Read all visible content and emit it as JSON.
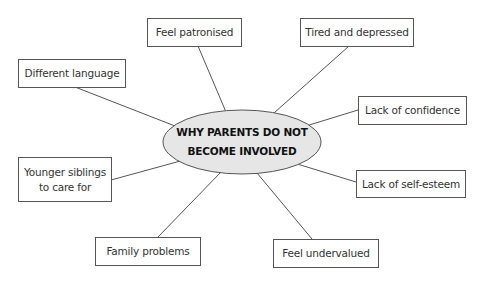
{
  "diagram": {
    "type": "mind-map",
    "colors": {
      "ellipse_fill": "#e6e6e6",
      "stroke": "#555555",
      "text": "#333333",
      "background": "#ffffff"
    },
    "center": {
      "label": "WHY PARENTS DO NOT\nBECOME INVOLVED"
    },
    "nodes": [
      {
        "id": "feel-patronised",
        "label": "Feel patronised"
      },
      {
        "id": "tired-and-depressed",
        "label": "Tired and depressed"
      },
      {
        "id": "different-language",
        "label": "Different language"
      },
      {
        "id": "lack-of-confidence",
        "label": "Lack of confidence"
      },
      {
        "id": "younger-siblings",
        "label": "Younger siblings\nto care for"
      },
      {
        "id": "lack-of-self-esteem",
        "label": "Lack of self-esteem"
      },
      {
        "id": "family-problems",
        "label": "Family problems"
      },
      {
        "id": "feel-undervalued",
        "label": "Feel undervalued"
      }
    ]
  }
}
